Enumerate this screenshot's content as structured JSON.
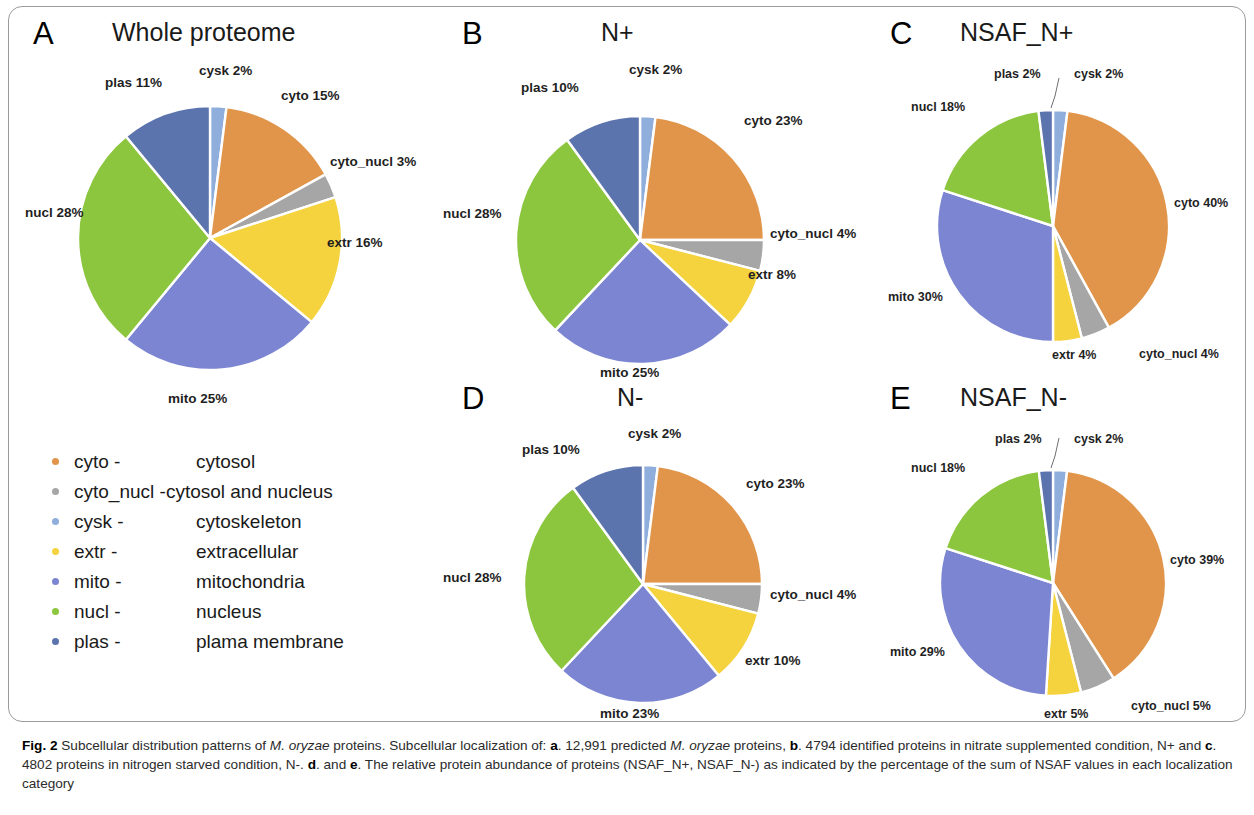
{
  "figure": {
    "caption_prefix": "Fig. 2",
    "caption_segments": [
      {
        "t": " Subcellular distribution patterns of ",
        "s": "normal"
      },
      {
        "t": "M. oryzae",
        "s": "italic"
      },
      {
        "t": " proteins. Subcellular localization of: ",
        "s": "normal"
      },
      {
        "t": "a",
        "s": "bold"
      },
      {
        "t": ". 12,991 predicted ",
        "s": "normal"
      },
      {
        "t": "M. oryzae",
        "s": "italic"
      },
      {
        "t": " proteins, ",
        "s": "normal"
      },
      {
        "t": "b",
        "s": "bold"
      },
      {
        "t": ". 4794 identified proteins in nitrate supplemented condition, N+ and ",
        "s": "normal"
      },
      {
        "t": "c",
        "s": "bold"
      },
      {
        "t": ". 4802 proteins in nitrogen starved condition, N-. ",
        "s": "normal"
      },
      {
        "t": "d",
        "s": "bold"
      },
      {
        "t": ". and ",
        "s": "normal"
      },
      {
        "t": "e",
        "s": "bold"
      },
      {
        "t": ". The relative protein abundance of proteins (NSAF_N+, NSAF_N-) as indicated by the percentage of the sum of NSAF values in each localization category",
        "s": "normal"
      }
    ]
  },
  "colors": {
    "cyto": "#E0954A",
    "cyto_nucl": "#A6A6A6",
    "cysk": "#8FAEDC",
    "extr": "#F5D33F",
    "mito": "#7B85D1",
    "nucl": "#8CC63E",
    "plas": "#5C74AD",
    "frame": "#9b9b9b",
    "text": "#1a1a1a"
  },
  "legend": {
    "items": [
      {
        "key": "cyto",
        "abbr": "cyto -",
        "name": "cytosol",
        "color": "#E0954A"
      },
      {
        "key": "cyto_nucl",
        "abbr": "cyto_nucl -",
        "name": "cytosol and nucleus",
        "color": "#A6A6A6"
      },
      {
        "key": "cysk",
        "abbr": "cysk -",
        "name": "cytoskeleton",
        "color": "#8FAEDC"
      },
      {
        "key": "extr",
        "abbr": "extr -",
        "name": "extracellular",
        "color": "#F5D33F"
      },
      {
        "key": "mito",
        "abbr": "mito -",
        "name": "mitochondria",
        "color": "#7B85D1"
      },
      {
        "key": "nucl",
        "abbr": "nucl -",
        "name": "nucleus",
        "color": "#8CC63E"
      },
      {
        "key": "plas",
        "abbr": "plas -",
        "name": "plama membrane",
        "color": "#5C74AD"
      }
    ]
  },
  "chart_data": [
    {
      "id": "A",
      "type": "pie",
      "letter": "A",
      "title": "Whole proteome",
      "categories": [
        "cysk",
        "cyto",
        "cyto_nucl",
        "extr",
        "mito",
        "nucl",
        "plas"
      ],
      "values": [
        2,
        15,
        3,
        16,
        25,
        28,
        11
      ],
      "labels": [
        "cysk 2%",
        "cyto 15%",
        "cyto_nucl 3%",
        "extr 16%",
        "mito 25%",
        "nucl 28%",
        "plas 11%"
      ],
      "colors": [
        "#8FAEDC",
        "#E0954A",
        "#A6A6A6",
        "#F5D33F",
        "#7B85D1",
        "#8CC63E",
        "#5C74AD"
      ],
      "start_angle_deg": 0,
      "direction": "clockwise",
      "legend": "labels outside slices"
    },
    {
      "id": "B",
      "type": "pie",
      "letter": "B",
      "title": "N+",
      "categories": [
        "cysk",
        "cyto",
        "cyto_nucl",
        "extr",
        "mito",
        "nucl",
        "plas"
      ],
      "values": [
        2,
        23,
        4,
        8,
        25,
        28,
        10
      ],
      "labels": [
        "cysk 2%",
        "cyto 23%",
        "cyto_nucl 4%",
        "extr 8%",
        "mito 25%",
        "nucl 28%",
        "plas 10%"
      ],
      "colors": [
        "#8FAEDC",
        "#E0954A",
        "#A6A6A6",
        "#F5D33F",
        "#7B85D1",
        "#8CC63E",
        "#5C74AD"
      ],
      "start_angle_deg": 0,
      "direction": "clockwise",
      "legend": "labels outside slices"
    },
    {
      "id": "C",
      "type": "pie",
      "letter": "C",
      "title": "NSAF_N+",
      "categories": [
        "cysk",
        "cyto",
        "cyto_nucl",
        "extr",
        "mito",
        "nucl",
        "plas"
      ],
      "values": [
        2,
        40,
        4,
        4,
        30,
        18,
        2
      ],
      "labels": [
        "cysk 2%",
        "cyto 40%",
        "cyto_nucl 4%",
        "extr 4%",
        "mito 30%",
        "nucl 18%",
        "plas 2%"
      ],
      "colors": [
        "#8FAEDC",
        "#E0954A",
        "#A6A6A6",
        "#F5D33F",
        "#7B85D1",
        "#8CC63E",
        "#5C74AD"
      ],
      "start_angle_deg": 0,
      "direction": "clockwise",
      "legend": "labels outside slices"
    },
    {
      "id": "D",
      "type": "pie",
      "letter": "D",
      "title": "N-",
      "categories": [
        "cysk",
        "cyto",
        "cyto_nucl",
        "extr",
        "mito",
        "nucl",
        "plas"
      ],
      "values": [
        2,
        23,
        4,
        10,
        23,
        28,
        10
      ],
      "labels": [
        "cysk 2%",
        "cyto 23%",
        "cyto_nucl 4%",
        "extr 10%",
        "mito 23%",
        "nucl 28%",
        "plas 10%"
      ],
      "colors": [
        "#8FAEDC",
        "#E0954A",
        "#A6A6A6",
        "#F5D33F",
        "#7B85D1",
        "#8CC63E",
        "#5C74AD"
      ],
      "start_angle_deg": 0,
      "direction": "clockwise",
      "legend": "labels outside slices"
    },
    {
      "id": "E",
      "type": "pie",
      "letter": "E",
      "title": "NSAF_N-",
      "categories": [
        "cysk",
        "cyto",
        "cyto_nucl",
        "extr",
        "mito",
        "nucl",
        "plas"
      ],
      "values": [
        2,
        39,
        5,
        5,
        29,
        18,
        2
      ],
      "labels": [
        "cysk 2%",
        "cyto 39%",
        "cyto_nucl 5%",
        "extr 5%",
        "mito 29%",
        "nucl 18%",
        "plas 2%"
      ],
      "colors": [
        "#8FAEDC",
        "#E0954A",
        "#A6A6A6",
        "#F5D33F",
        "#7B85D1",
        "#8CC63E",
        "#5C74AD"
      ],
      "start_angle_deg": 0,
      "direction": "clockwise",
      "legend": "labels outside slices"
    }
  ],
  "panel_layout": [
    {
      "id": "A",
      "letter_x": 33,
      "letter_y": 18,
      "title_x": 112,
      "title_y": 20,
      "cx": 210,
      "cy": 238,
      "r": 132,
      "labels": [
        {
          "idx": 0,
          "x": 199,
          "y": 64,
          "anchor": "start"
        },
        {
          "idx": 1,
          "x": 281,
          "y": 89,
          "anchor": "start"
        },
        {
          "idx": 2,
          "x": 330,
          "y": 155,
          "anchor": "start"
        },
        {
          "idx": 3,
          "x": 327,
          "y": 236,
          "anchor": "start"
        },
        {
          "idx": 4,
          "x": 168,
          "y": 392,
          "anchor": "start"
        },
        {
          "idx": 5,
          "x": 25,
          "y": 206,
          "anchor": "start"
        },
        {
          "idx": 6,
          "x": 105,
          "y": 76,
          "anchor": "start"
        }
      ]
    },
    {
      "id": "B",
      "letter_x": 462,
      "letter_y": 18,
      "title_x": 601,
      "title_y": 20,
      "cx": 640,
      "cy": 240,
      "r": 124,
      "labels": [
        {
          "idx": 0,
          "x": 629,
          "y": 63,
          "anchor": "start"
        },
        {
          "idx": 1,
          "x": 744,
          "y": 114,
          "anchor": "start"
        },
        {
          "idx": 2,
          "x": 770,
          "y": 227,
          "anchor": "start"
        },
        {
          "idx": 3,
          "x": 748,
          "y": 268,
          "anchor": "start"
        },
        {
          "idx": 4,
          "x": 600,
          "y": 366,
          "anchor": "start"
        },
        {
          "idx": 5,
          "x": 443,
          "y": 207,
          "anchor": "start"
        },
        {
          "idx": 6,
          "x": 521,
          "y": 81,
          "anchor": "start"
        }
      ]
    },
    {
      "id": "C",
      "letter_x": 890,
      "letter_y": 18,
      "title_x": 960,
      "title_y": 20,
      "cx": 1053,
      "cy": 226,
      "r": 116,
      "labels": [
        {
          "idx": 0,
          "x": 1074,
          "y": 68,
          "anchor": "start"
        },
        {
          "idx": 1,
          "x": 1174,
          "y": 197,
          "anchor": "start"
        },
        {
          "idx": 2,
          "x": 1139,
          "y": 348,
          "anchor": "start"
        },
        {
          "idx": 3,
          "x": 1052,
          "y": 349,
          "anchor": "start"
        },
        {
          "idx": 4,
          "x": 888,
          "y": 291,
          "anchor": "start"
        },
        {
          "idx": 5,
          "x": 911,
          "y": 101,
          "anchor": "start"
        },
        {
          "idx": 6,
          "x": 994,
          "y": 68,
          "anchor": "start"
        }
      ]
    },
    {
      "id": "D",
      "letter_x": 462,
      "letter_y": 383,
      "title_x": 617,
      "title_y": 385,
      "cx": 643,
      "cy": 584,
      "r": 119,
      "labels": [
        {
          "idx": 0,
          "x": 628,
          "y": 427,
          "anchor": "start"
        },
        {
          "idx": 1,
          "x": 746,
          "y": 477,
          "anchor": "start"
        },
        {
          "idx": 2,
          "x": 770,
          "y": 588,
          "anchor": "start"
        },
        {
          "idx": 3,
          "x": 745,
          "y": 654,
          "anchor": "start"
        },
        {
          "idx": 4,
          "x": 600,
          "y": 707,
          "anchor": "start"
        },
        {
          "idx": 5,
          "x": 443,
          "y": 571,
          "anchor": "start"
        },
        {
          "idx": 6,
          "x": 522,
          "y": 443,
          "anchor": "start"
        }
      ]
    },
    {
      "id": "E",
      "letter_x": 890,
      "letter_y": 383,
      "title_x": 960,
      "title_y": 385,
      "cx": 1053,
      "cy": 583,
      "r": 113,
      "labels": [
        {
          "idx": 0,
          "x": 1074,
          "y": 433,
          "anchor": "start"
        },
        {
          "idx": 1,
          "x": 1170,
          "y": 554,
          "anchor": "start"
        },
        {
          "idx": 2,
          "x": 1131,
          "y": 700,
          "anchor": "start"
        },
        {
          "idx": 3,
          "x": 1044,
          "y": 708,
          "anchor": "start"
        },
        {
          "idx": 4,
          "x": 890,
          "y": 646,
          "anchor": "start"
        },
        {
          "idx": 5,
          "x": 911,
          "y": 462,
          "anchor": "start"
        },
        {
          "idx": 6,
          "x": 995,
          "y": 433,
          "anchor": "start"
        }
      ]
    }
  ]
}
